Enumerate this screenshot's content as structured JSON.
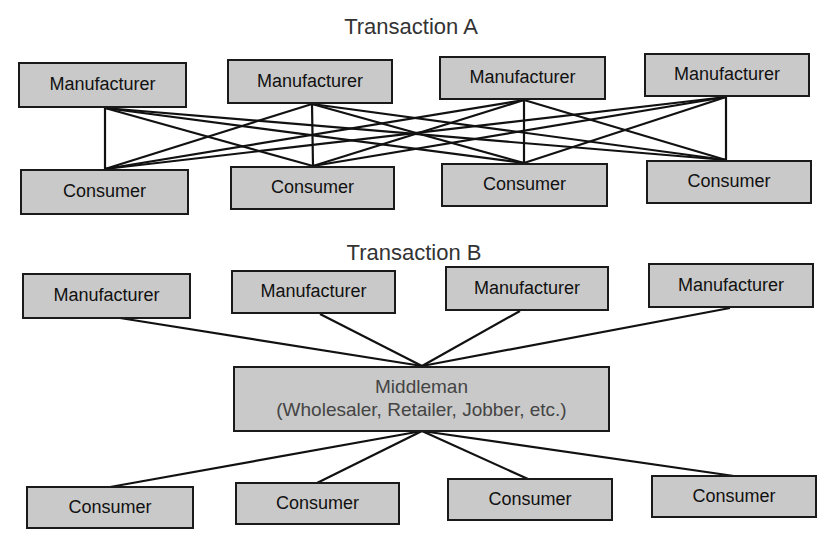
{
  "transaction_a": {
    "title": "Transaction A",
    "manufacturers": [
      "Manufacturer",
      "Manufacturer",
      "Manufacturer",
      "Manufacturer"
    ],
    "consumers": [
      "Consumer",
      "Consumer",
      "Consumer",
      "Consumer"
    ],
    "connection": "every manufacturer linked to every consumer"
  },
  "transaction_b": {
    "title": "Transaction B",
    "manufacturers": [
      "Manufacturer",
      "Manufacturer",
      "Manufacturer",
      "Manufacturer"
    ],
    "middleman": {
      "label": "Middleman",
      "sublabel": "(Wholesaler, Retailer, Jobber, etc.)"
    },
    "consumers": [
      "Consumer",
      "Consumer",
      "Consumer",
      "Consumer"
    ],
    "connection": "all manufacturers and consumers linked through middleman"
  }
}
